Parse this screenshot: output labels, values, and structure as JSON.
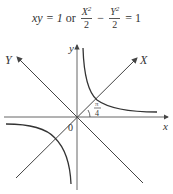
{
  "equation": {
    "part1": "xy = 1",
    "connector": "or",
    "frac1_num": "X",
    "frac1_sup": "2",
    "frac1_den": "2",
    "minus": "−",
    "frac2_num": "Y",
    "frac2_sup": "2",
    "frac2_den": "2",
    "rhs": "= 1"
  },
  "labels": {
    "x_axis": "x",
    "y_axis": "y",
    "X_axis": "X",
    "Y_axis": "Y",
    "origin": "0",
    "angle_num": "π",
    "angle_den": "4"
  },
  "colors": {
    "line": "#444444",
    "curve": "#333333",
    "text": "#333333"
  }
}
